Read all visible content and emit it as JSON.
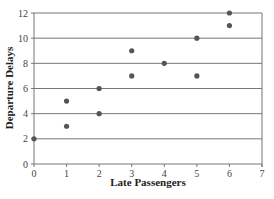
{
  "chart_data": {
    "type": "scatter",
    "title": "",
    "xlabel": "Late Passengers",
    "ylabel": "Departure Delays",
    "xlim": [
      0,
      7
    ],
    "ylim": [
      0,
      12
    ],
    "x_ticks": [
      0,
      1,
      2,
      3,
      4,
      5,
      6,
      7
    ],
    "y_ticks": [
      0,
      2,
      4,
      6,
      8,
      10,
      12
    ],
    "grid": "horizontal",
    "legend": null,
    "series": [
      {
        "name": "Data",
        "color": "#555555",
        "points": [
          {
            "x": 0,
            "y": 2
          },
          {
            "x": 1,
            "y": 3
          },
          {
            "x": 1,
            "y": 5
          },
          {
            "x": 2,
            "y": 4
          },
          {
            "x": 2,
            "y": 6
          },
          {
            "x": 3,
            "y": 7
          },
          {
            "x": 3,
            "y": 9
          },
          {
            "x": 4,
            "y": 8
          },
          {
            "x": 5,
            "y": 7
          },
          {
            "x": 5,
            "y": 10
          },
          {
            "x": 6,
            "y": 11
          },
          {
            "x": 6,
            "y": 12
          }
        ]
      }
    ]
  }
}
